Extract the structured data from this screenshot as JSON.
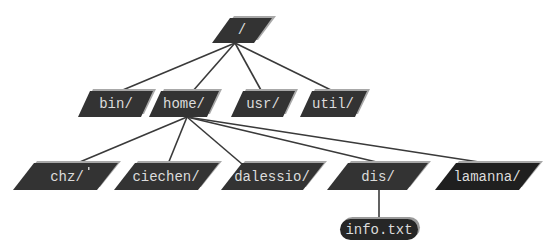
{
  "diagram": {
    "type": "directory-tree",
    "root": {
      "id": "root",
      "label": "/",
      "kind": "directory"
    },
    "nodes": [
      {
        "id": "root",
        "label": "/",
        "kind": "directory",
        "parent": null
      },
      {
        "id": "bin",
        "label": "bin/",
        "kind": "directory",
        "parent": "root"
      },
      {
        "id": "home",
        "label": "home/",
        "kind": "directory",
        "parent": "root"
      },
      {
        "id": "usr",
        "label": "usr/",
        "kind": "directory",
        "parent": "root"
      },
      {
        "id": "util",
        "label": "util/",
        "kind": "directory",
        "parent": "root"
      },
      {
        "id": "chz",
        "label": "chz/",
        "kind": "directory",
        "parent": "home"
      },
      {
        "id": "ciechen",
        "label": "ciechen/",
        "kind": "directory",
        "parent": "home"
      },
      {
        "id": "dalessio",
        "label": "dalessio/",
        "kind": "directory",
        "parent": "home"
      },
      {
        "id": "dis",
        "label": "dis/",
        "kind": "directory",
        "parent": "home"
      },
      {
        "id": "lamanna",
        "label": "lamanna/",
        "kind": "directory",
        "parent": "home"
      },
      {
        "id": "info",
        "label": "info.txt",
        "kind": "file",
        "parent": "dis"
      }
    ],
    "edges": [
      [
        "root",
        "bin"
      ],
      [
        "root",
        "home"
      ],
      [
        "root",
        "usr"
      ],
      [
        "root",
        "util"
      ],
      [
        "home",
        "chz"
      ],
      [
        "home",
        "ciechen"
      ],
      [
        "home",
        "dalessio"
      ],
      [
        "home",
        "dis"
      ],
      [
        "home",
        "lamanna"
      ],
      [
        "dis",
        "info"
      ]
    ],
    "colors": {
      "node_fill": "#333333",
      "node_fill_dark": "#1f1f1f",
      "node_shadow": "#a8a8a8",
      "label_text": "#dcdcdc",
      "edge": "#3a3a3a",
      "background": "#ffffff"
    }
  },
  "labels": {
    "root": "/",
    "bin": "bin/",
    "home": "home/",
    "usr": "usr/",
    "util": "util/",
    "chz": "chz/",
    "ciechen": "ciechen/",
    "dalessio": "dalessio/",
    "dis": "dis/",
    "lamanna": "lamanna/",
    "info": "info.txt"
  }
}
